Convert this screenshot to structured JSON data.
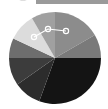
{
  "image": {
    "description": "Grayscale pie-shaped graphic with a path-edit overlay (line with circular node handles) and a partial grey header strip at top",
    "center": [
      55,
      58
    ],
    "radius": 46,
    "slices": [
      {
        "start": 0,
        "end": 60,
        "color": "#8c8c8c"
      },
      {
        "start": 60,
        "end": 90,
        "color": "#7a7a7a"
      },
      {
        "start": 90,
        "end": 200,
        "color": "#141414"
      },
      {
        "start": 200,
        "end": 235,
        "color": "#2c2c2c"
      },
      {
        "start": 235,
        "end": 270,
        "color": "#3c3c3c"
      },
      {
        "start": 270,
        "end": 295,
        "color": "#6e6e6e"
      },
      {
        "start": 295,
        "end": 330,
        "color": "#dcdcdc"
      },
      {
        "start": 330,
        "end": 360,
        "color": "#a0a0a0"
      }
    ],
    "overlay": {
      "nodes": [
        [
          34,
          37
        ],
        [
          48,
          29
        ],
        [
          66,
          31
        ]
      ],
      "stroke": "#ffffff"
    },
    "header_color": "#9a9a9a"
  }
}
